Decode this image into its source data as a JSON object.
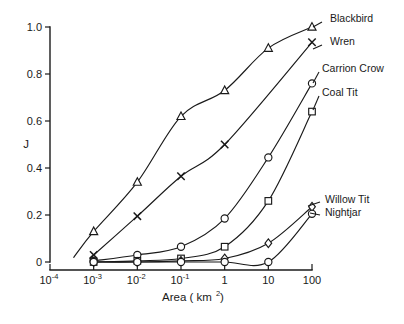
{
  "chart_data": {
    "type": "line",
    "title": "",
    "xlabel": "Area (km²)",
    "ylabel": "J",
    "xlabel_parts": {
      "text": "Area ( km",
      "sup": "2",
      "tail": " )"
    },
    "x_scale": "log",
    "xlim": [
      0.0001,
      100
    ],
    "ylim": [
      0,
      1.0
    ],
    "grid": false,
    "legend_position": "right-inline-labels",
    "x_ticks": [
      {
        "value": 0.0001,
        "label": "10",
        "sup": "-4"
      },
      {
        "value": 0.001,
        "label": "10",
        "sup": "-3"
      },
      {
        "value": 0.01,
        "label": "10",
        "sup": "-2"
      },
      {
        "value": 0.1,
        "label": "10",
        "sup": "-1"
      },
      {
        "value": 1,
        "label": "1",
        "sup": ""
      },
      {
        "value": 10,
        "label": "10",
        "sup": ""
      },
      {
        "value": 100,
        "label": "100",
        "sup": ""
      }
    ],
    "y_ticks": [
      {
        "value": 0,
        "label": "0"
      },
      {
        "value": 0.2,
        "label": "0.2"
      },
      {
        "value": 0.4,
        "label": "0.4"
      },
      {
        "value": 0.6,
        "label": "0.6"
      },
      {
        "value": 0.8,
        "label": "0.8"
      },
      {
        "value": 1.0,
        "label": "1.0"
      }
    ],
    "series": [
      {
        "name": "Blackbird",
        "marker": "triangle",
        "label_x": 330,
        "label_y": 22,
        "leader": [
          [
            313,
            27
          ],
          [
            322,
            22
          ]
        ],
        "x": [
          0.001,
          0.01,
          0.1,
          1,
          10,
          100
        ],
        "y": [
          0.13,
          0.34,
          0.62,
          0.73,
          0.91,
          1.0
        ],
        "curve_start": [
          0.00035,
          0.02
        ]
      },
      {
        "name": "Wren",
        "marker": "cross",
        "label_x": 330,
        "label_y": 45,
        "leader": [
          [
            313,
            49
          ],
          [
            322,
            45
          ]
        ],
        "x": [
          0.001,
          0.01,
          0.1,
          1,
          100
        ],
        "y": [
          0.03,
          0.195,
          0.365,
          0.5,
          0.935
        ],
        "curve_start": [
          0.0009,
          0.025
        ]
      },
      {
        "name": "Carrion Crow",
        "marker": "circle",
        "label_x": 322,
        "label_y": 72,
        "leader": [
          [
            313,
            83
          ],
          [
            319,
            72
          ]
        ],
        "x": [
          0.001,
          0.01,
          0.1,
          1,
          10,
          100
        ],
        "y": [
          0.005,
          0.03,
          0.065,
          0.185,
          0.445,
          0.76
        ],
        "curve_start": [
          0.001,
          0.005
        ]
      },
      {
        "name": "Coal Tit",
        "marker": "square",
        "label_x": 322,
        "label_y": 96,
        "leader": [
          [
            313,
            110
          ],
          [
            319,
            96
          ]
        ],
        "x": [
          0.001,
          0.01,
          0.1,
          1,
          10,
          100
        ],
        "y": [
          0.0,
          0.005,
          0.015,
          0.065,
          0.26,
          0.64
        ],
        "curve_start": [
          0.001,
          0.0
        ]
      },
      {
        "name": "Willow Tit",
        "marker": "diamond",
        "label_x": 325,
        "label_y": 203,
        "leader": [
          [
            308,
            206
          ],
          [
            320,
            202
          ]
        ],
        "x": [
          0.001,
          0.01,
          0.1,
          1,
          10,
          100
        ],
        "y": [
          0.0,
          0.0,
          0.005,
          0.015,
          0.08,
          0.235
        ],
        "curve_start": [
          0.001,
          0.0
        ]
      },
      {
        "name": "Nightjar",
        "marker": "circle",
        "label_x": 325,
        "label_y": 216,
        "leader": [
          [
            310,
            213
          ],
          [
            320,
            215
          ]
        ],
        "x": [
          0.001,
          0.01,
          0.1,
          1,
          10,
          100
        ],
        "y": [
          0.0,
          0.0,
          0.0,
          0.0,
          0.0,
          0.205
        ],
        "curve_start": [
          0.001,
          0.0
        ]
      }
    ]
  }
}
